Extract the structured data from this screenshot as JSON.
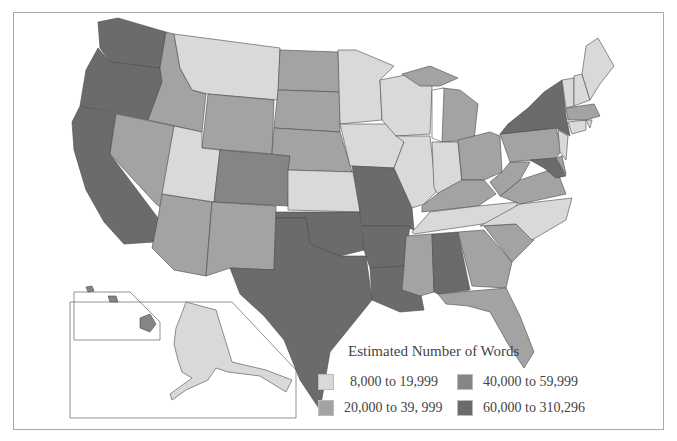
{
  "map": {
    "legend": {
      "title": "Estimated Number of Words",
      "items": [
        {
          "label": "8,000 to 19,999",
          "color": "#d9d9d9"
        },
        {
          "label": "20,000 to 39, 999",
          "color": "#a3a3a3"
        },
        {
          "label": "40,000 to 59,999",
          "color": "#858585"
        },
        {
          "label": "60,000 to 310,296",
          "color": "#6b6b6b"
        }
      ]
    },
    "colors": {
      "c1": "#d9d9d9",
      "c2": "#a3a3a3",
      "c3": "#858585",
      "c4": "#6b6b6b"
    }
  }
}
